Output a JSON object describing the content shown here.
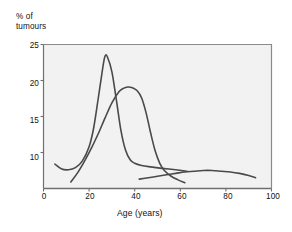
{
  "chart_data": {
    "type": "line",
    "title": "",
    "subtitle": "",
    "xlabel": "Age (years)",
    "ylabel": "% of\ntumours",
    "ylabel_line1": "% of",
    "ylabel_line2": "tumours",
    "xlim": [
      0,
      100
    ],
    "ylim": [
      5,
      25
    ],
    "xticks": [
      0,
      20,
      40,
      60,
      80,
      100
    ],
    "xtick_labels": [
      "0",
      "20",
      "40",
      "60",
      "80",
      "100"
    ],
    "yticks": [
      10,
      15,
      20,
      25
    ],
    "ytick_labels": [
      "10",
      "15",
      "20",
      "25"
    ],
    "grid": false,
    "legend_position": "inline-annotations",
    "line_color": "#4a4a4a",
    "plot_background": "#f2f2f2",
    "axis_color": "#808080",
    "series": [
      {
        "name": "Teratoma",
        "label": "Teratoma",
        "annotation_x": 33,
        "annotation_y": 23.6,
        "peak_age": 27,
        "peak_value": 23.4,
        "x": [
          5,
          8,
          11,
          14,
          17,
          20,
          22,
          24,
          26,
          27,
          28,
          30,
          32,
          34,
          36,
          38,
          40,
          43,
          47,
          52,
          58,
          63
        ],
        "y": [
          8.4,
          7.7,
          7.6,
          7.9,
          8.8,
          10.8,
          13.4,
          17.5,
          21.8,
          23.4,
          23.3,
          21.2,
          17.2,
          13.0,
          10.3,
          9.0,
          8.5,
          8.2,
          8.0,
          7.8,
          7.6,
          7.4
        ]
      },
      {
        "name": "Seminoma",
        "label": "Seminoma",
        "annotation_x": 45,
        "annotation_y": 19.6,
        "peak_age": 38,
        "peak_value": 19.1,
        "x": [
          12,
          15,
          18,
          21,
          24,
          27,
          30,
          33,
          35,
          37,
          39,
          41,
          43,
          45,
          47,
          49,
          51,
          53,
          56,
          59,
          62
        ],
        "y": [
          5.9,
          7.2,
          8.8,
          10.6,
          12.6,
          14.8,
          16.9,
          18.4,
          18.9,
          19.1,
          19.0,
          18.6,
          17.6,
          15.5,
          12.7,
          10.2,
          8.5,
          7.5,
          6.7,
          6.2,
          5.8
        ]
      },
      {
        "name": "Lymphoma",
        "label": "Lymphoma",
        "annotation_x": 72,
        "annotation_y": 9.3,
        "peak_age": 72,
        "peak_value": 7.6,
        "x": [
          42,
          46,
          50,
          54,
          58,
          62,
          66,
          70,
          74,
          78,
          82,
          86,
          90,
          93
        ],
        "y": [
          6.3,
          6.5,
          6.7,
          6.9,
          7.1,
          7.3,
          7.4,
          7.5,
          7.5,
          7.4,
          7.3,
          7.1,
          6.8,
          6.5
        ]
      }
    ]
  },
  "axes": {
    "ylabel_line1": "% of",
    "ylabel_line2": "tumours",
    "xlabel": "Age (years)",
    "ytick_labels": [
      "25",
      "20",
      "15",
      "10"
    ],
    "xtick_labels": [
      "0",
      "20",
      "40",
      "60",
      "80",
      "100"
    ]
  },
  "labels": {
    "teratoma": "Teratoma",
    "seminoma": "Seminoma",
    "lymphoma": "Lymphoma"
  }
}
